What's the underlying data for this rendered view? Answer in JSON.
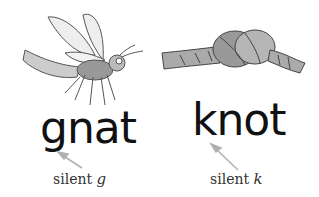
{
  "panels": [
    {
      "illustration": "gnat-insect-drawing",
      "word": "gnat",
      "caption_prefix": "silent",
      "caption_letter": "g"
    },
    {
      "illustration": "knotted-rope-drawing",
      "word": "knot",
      "caption_prefix": "silent",
      "caption_letter": "k"
    }
  ],
  "colors": {
    "text": "#111111",
    "caption": "#333333",
    "arrow": "#b0b0b0"
  }
}
